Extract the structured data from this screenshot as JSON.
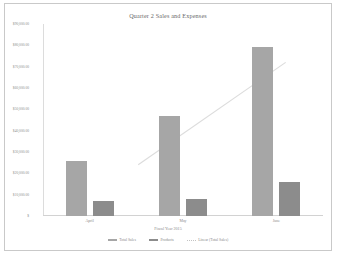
{
  "chart_data": {
    "type": "bar",
    "title": "Quarter 2 Sales and Expenses",
    "xlabel": "Fiscal Year 2015",
    "ylabel": "",
    "categories": [
      "April",
      "May",
      "June"
    ],
    "series": [
      {
        "name": "Total Sales",
        "values": [
          26000,
          47000,
          79000
        ],
        "color": "#a6a6a6"
      },
      {
        "name": "Products",
        "values": [
          7000,
          8000,
          16000
        ],
        "color": "#8c8c8c"
      }
    ],
    "trendline": {
      "name": "Linear (Total Sales)",
      "color": "#dcdcdc",
      "points": [
        [
          0.52,
          24000
        ],
        [
          2.1,
          72000
        ]
      ]
    },
    "ylim": [
      0,
      90000
    ],
    "ytick_values": [
      90000,
      80000,
      70000,
      60000,
      50000,
      40000,
      30000,
      20000,
      10000,
      0
    ],
    "ytick_labels": [
      "$90,000.00",
      "$80,000.00",
      "$70,000.00",
      "$60,000.00",
      "$50,000.00",
      "$40,000.00",
      "$30,000.00",
      "$20,000.00",
      "$10,000.00",
      "$"
    ],
    "grid": false,
    "legend_position": "bottom"
  },
  "legend": {
    "items": [
      {
        "label": "Total Sales",
        "type": "bar",
        "color": "#a6a6a6"
      },
      {
        "label": "Products",
        "type": "bar",
        "color": "#8c8c8c"
      },
      {
        "label": "Linear (Total Sales)",
        "type": "line",
        "color": "#c3c3c3"
      }
    ]
  }
}
